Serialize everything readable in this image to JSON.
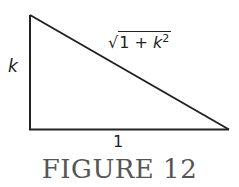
{
  "figure": {
    "caption": "FIGURE 12",
    "vertical_side_label": "k",
    "horizontal_side_label": "1",
    "hypotenuse_label": {
      "radical": "√",
      "body": "1 + ",
      "variable": "k",
      "exponent": "2"
    },
    "line_color": "#222222",
    "caption_color": "#555555"
  }
}
